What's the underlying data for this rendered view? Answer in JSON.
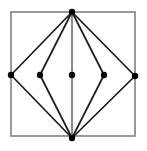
{
  "figure": {
    "canvas": {
      "width": 147,
      "height": 151,
      "background": "#ffffff"
    },
    "colors": {
      "frame": "#808080",
      "edge": "#1a1a1a",
      "vertex": "#000000",
      "axis_line": "#8c8c8c"
    },
    "style": {
      "frame_stroke_width": 1.6,
      "edge_stroke_width": 1.7,
      "vertical_stroke_width": 2.0,
      "vertex_radius": 3.2
    }
  },
  "chart_data": {
    "type": "diagram",
    "title": "Nested diamond graph inscribed in a square",
    "xlabel": "",
    "ylabel": "",
    "xlim": [
      0,
      147
    ],
    "ylim": [
      0,
      151
    ],
    "grid": false,
    "legend": null,
    "square_frame": {
      "label": "bounding square",
      "x": 11,
      "y": 12,
      "width": 124,
      "height": 124,
      "corners": [
        [
          11,
          12
        ],
        [
          135,
          12
        ],
        [
          135,
          136
        ],
        [
          11,
          136
        ]
      ],
      "color": "#808080"
    },
    "nodes": [
      {
        "id": "top",
        "label": "top apex",
        "x": 72,
        "y": 12
      },
      {
        "id": "left",
        "label": "left outer vertex",
        "x": 11,
        "y": 75
      },
      {
        "id": "mid_left",
        "label": "left inner vertex",
        "x": 40,
        "y": 75
      },
      {
        "id": "center",
        "label": "center vertex",
        "x": 72,
        "y": 75
      },
      {
        "id": "mid_right",
        "label": "right inner vertex",
        "x": 104,
        "y": 75
      },
      {
        "id": "right",
        "label": "right outer vertex",
        "x": 135,
        "y": 76
      },
      {
        "id": "bottom",
        "label": "bottom apex",
        "x": 72,
        "y": 138
      }
    ],
    "edges": [
      {
        "from": "top",
        "to": "left",
        "color": "#1a1a1a",
        "width": 1.7
      },
      {
        "from": "top",
        "to": "mid_left",
        "color": "#1a1a1a",
        "width": 1.7
      },
      {
        "from": "top",
        "to": "center",
        "color": "#8c8c8c",
        "width": 2.0
      },
      {
        "from": "top",
        "to": "mid_right",
        "color": "#1a1a1a",
        "width": 1.7
      },
      {
        "from": "top",
        "to": "right",
        "color": "#1a1a1a",
        "width": 1.7
      },
      {
        "from": "bottom",
        "to": "left",
        "color": "#1a1a1a",
        "width": 1.7
      },
      {
        "from": "bottom",
        "to": "mid_left",
        "color": "#1a1a1a",
        "width": 1.7
      },
      {
        "from": "bottom",
        "to": "center",
        "color": "#8c8c8c",
        "width": 2.0
      },
      {
        "from": "bottom",
        "to": "mid_right",
        "color": "#1a1a1a",
        "width": 1.7
      },
      {
        "from": "bottom",
        "to": "right",
        "color": "#1a1a1a",
        "width": 1.7
      }
    ],
    "counts": {
      "nodes": 7,
      "edges": 10,
      "diamonds": 2
    },
    "annotations": []
  }
}
